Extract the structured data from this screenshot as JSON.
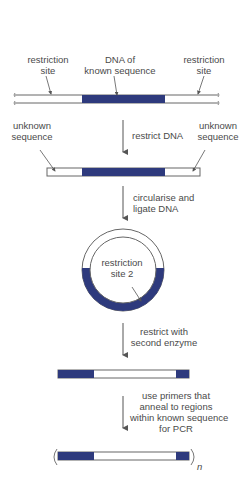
{
  "colors": {
    "dna_known": "#2e3a7d",
    "dna_unknown": "#ffffff",
    "outline": "#666666",
    "text": "#4a4a4a"
  },
  "step1": {
    "label_left": [
      "restriction",
      "site"
    ],
    "label_center": [
      "DNA of",
      "known sequence"
    ],
    "label_right": [
      "restriction",
      "site"
    ]
  },
  "step2": {
    "arrow_label": "restrict DNA",
    "label_left": [
      "unknown",
      "sequence"
    ],
    "label_right": [
      "unknown",
      "sequence"
    ]
  },
  "step3": {
    "arrow_label": [
      "circularise and",
      "ligate DNA"
    ],
    "circle_label": [
      "restriction",
      "site 2"
    ]
  },
  "step4": {
    "arrow_label": [
      "restrict with",
      "second enzyme"
    ]
  },
  "step5": {
    "arrow_label": [
      "use primers that",
      "anneal to regions",
      "within known sequence",
      "for PCR"
    ],
    "multiplier": "n"
  }
}
